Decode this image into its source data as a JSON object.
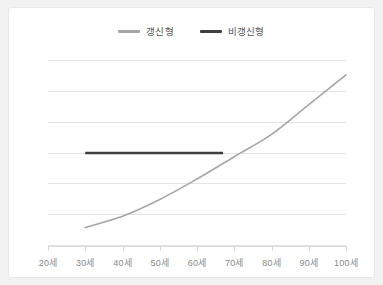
{
  "chart_data": {
    "type": "line",
    "title": "",
    "xlabel": "",
    "ylabel": "",
    "grid": true,
    "gridline_count": 7,
    "legend_position": "top-center",
    "x": [
      "20세",
      "30세",
      "40세",
      "50세",
      "60세",
      "70세",
      "80세",
      "90세",
      "100세"
    ],
    "xlim": [
      20,
      100
    ],
    "ylim": [
      0,
      100
    ],
    "series": [
      {
        "name": "갱신형",
        "color": "#a6a6a6",
        "x": [
          30,
          40,
          50,
          60,
          70,
          80,
          90,
          100
        ],
        "values": [
          10,
          16,
          25,
          36,
          48,
          60,
          76,
          92
        ]
      },
      {
        "name": "비갱신형",
        "color": "#3f3f3f",
        "x": [
          30,
          67
        ],
        "values": [
          50,
          50
        ]
      }
    ]
  },
  "legend": {
    "items": [
      {
        "label": "갱신형",
        "swatch": "line-swatch-gray"
      },
      {
        "label": "비갱신형",
        "swatch": "line-swatch-dark"
      }
    ]
  },
  "axis": {
    "x_ticks": [
      "20세",
      "30세",
      "40세",
      "50세",
      "60세",
      "70세",
      "80세",
      "90세",
      "100세"
    ]
  },
  "colors": {
    "renewable": "#a6a6a6",
    "non_renewable": "#3f3f3f",
    "gridline": "#e4e4e4",
    "axis": "#d9d9d9",
    "tick_label": "#8a8a8a",
    "legend_label": "#555555",
    "card_background": "#ffffff",
    "page_background": "#f2f2f2"
  }
}
